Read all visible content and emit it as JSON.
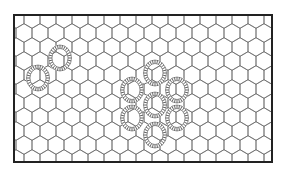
{
  "figure": {
    "frame": {
      "x": 14,
      "y": 15,
      "width": 258,
      "height": 147,
      "stroke": "#222222",
      "stroke_width": 2
    },
    "lattice": {
      "type": "hexagonal",
      "orientation": "pointy-top",
      "cell_width": 16,
      "row_pitch": 14,
      "stroke": "#666666"
    },
    "ring_style": {
      "rx": 10,
      "ry": 11.5,
      "bead_color": "#555555",
      "bead_count": 28
    },
    "rings": [
      {
        "id": "ring-left-upper",
        "cx": 60,
        "cy": 58
      },
      {
        "id": "ring-left-lower",
        "cx": 38,
        "cy": 78
      },
      {
        "id": "ring-cluster-top",
        "cx": 155,
        "cy": 73
      },
      {
        "id": "ring-cluster-upper-left",
        "cx": 132,
        "cy": 90
      },
      {
        "id": "ring-cluster-upper-right",
        "cx": 177,
        "cy": 90
      },
      {
        "id": "ring-cluster-center",
        "cx": 155,
        "cy": 105
      },
      {
        "id": "ring-cluster-lower-left",
        "cx": 132,
        "cy": 118
      },
      {
        "id": "ring-cluster-lower-right",
        "cx": 177,
        "cy": 118
      },
      {
        "id": "ring-cluster-bottom",
        "cx": 155,
        "cy": 135
      }
    ]
  }
}
